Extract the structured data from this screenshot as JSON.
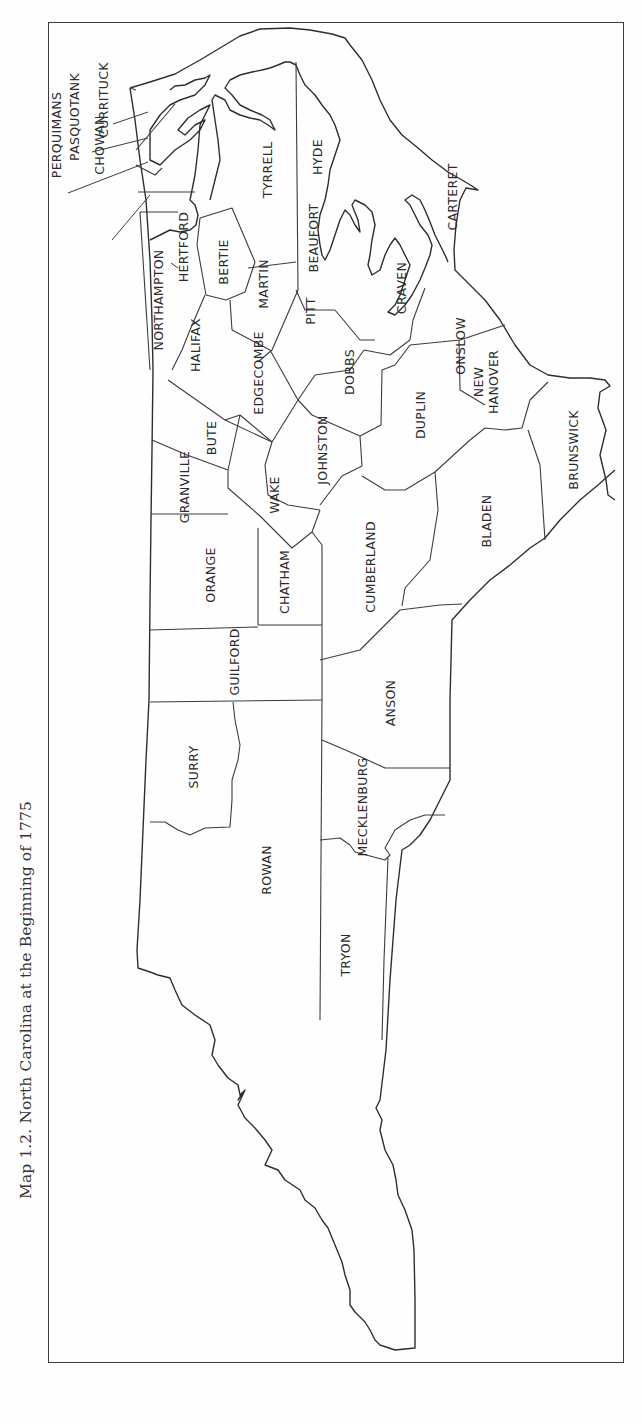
{
  "caption": "Map 1.2. North Carolina at the Beginning of 1775",
  "map": {
    "orientation": "rotated-90-ccw",
    "line_color": "#3c3c3c",
    "counties": [
      {
        "name": "CURRITUCK",
        "x": 103,
        "y": 100
      },
      {
        "name": "PASQUOTANK",
        "x": 83,
        "y": 117
      },
      {
        "name": "PERQUIMANS",
        "x": 61,
        "y": 135
      },
      {
        "name": "CHOWAN",
        "x": 103,
        "y": 145
      },
      {
        "name": "NORTHAMPTON",
        "x": 162,
        "y": 300
      },
      {
        "name": "HERTFORD",
        "x": 186,
        "y": 247
      },
      {
        "name": "BERTIE",
        "x": 218,
        "y": 262
      },
      {
        "name": "TYRRELL",
        "x": 268,
        "y": 170
      },
      {
        "name": "HYDE",
        "x": 320,
        "y": 155
      },
      {
        "name": "BEAUFORT",
        "x": 315,
        "y": 238
      },
      {
        "name": "MARTIN",
        "x": 264,
        "y": 284
      },
      {
        "name": "PITT",
        "x": 311,
        "y": 311
      },
      {
        "name": "CRAVEN",
        "x": 401,
        "y": 288
      },
      {
        "name": "CARTERET",
        "x": 453,
        "y": 197
      },
      {
        "name": "ONSLOW",
        "x": 461,
        "y": 346
      },
      {
        "name": "HALIFAX",
        "x": 196,
        "y": 345
      },
      {
        "name": "EDGECOMBE",
        "x": 259,
        "y": 373
      },
      {
        "name": "DOBBS",
        "x": 350,
        "y": 372
      },
      {
        "name": "NEW HANOVER",
        "x": 488,
        "y": 380
      },
      {
        "name": "BUTE",
        "x": 212,
        "y": 438
      },
      {
        "name": "GRANVILLE",
        "x": 185,
        "y": 487
      },
      {
        "name": "JOHNSTON",
        "x": 323,
        "y": 450
      },
      {
        "name": "DUPLIN",
        "x": 421,
        "y": 415
      },
      {
        "name": "BRUNSWICK",
        "x": 574,
        "y": 450
      },
      {
        "name": "WAKE",
        "x": 275,
        "y": 495
      },
      {
        "name": "ORANGE",
        "x": 211,
        "y": 575
      },
      {
        "name": "CHATHAM",
        "x": 285,
        "y": 580
      },
      {
        "name": "CUMBERLAND",
        "x": 371,
        "y": 565
      },
      {
        "name": "BLADEN",
        "x": 487,
        "y": 521
      },
      {
        "name": "GUILFORD",
        "x": 235,
        "y": 664
      },
      {
        "name": "ANSON",
        "x": 391,
        "y": 703
      },
      {
        "name": "SURRY",
        "x": 194,
        "y": 767
      },
      {
        "name": "MECKLENBURG",
        "x": 363,
        "y": 807
      },
      {
        "name": "ROWAN",
        "x": 267,
        "y": 870
      },
      {
        "name": "TRYON",
        "x": 346,
        "y": 955
      }
    ]
  }
}
